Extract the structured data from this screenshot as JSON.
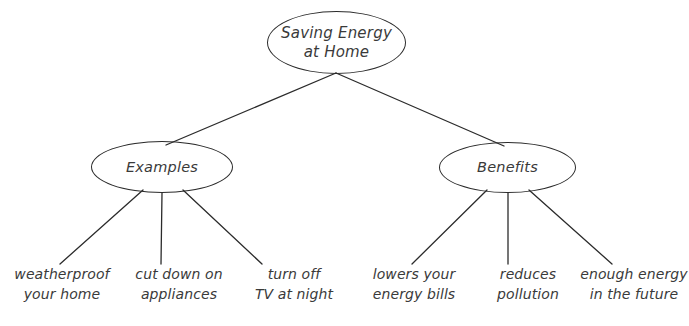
{
  "diagram": {
    "type": "concept-map",
    "stroke_color": "#2b2b2b",
    "text_color": "#3a3a3a",
    "background_color": "#ffffff",
    "root": {
      "label": "Saving Energy\nat Home"
    },
    "branches": [
      {
        "label": "Examples",
        "leaves": [
          {
            "label": "weatherproof\nyour home"
          },
          {
            "label": "cut down on\nappliances"
          },
          {
            "label": "turn off\nTV at night"
          }
        ]
      },
      {
        "label": "Benefits",
        "leaves": [
          {
            "label": "lowers your\nenergy bills"
          },
          {
            "label": "reduces\npollution"
          },
          {
            "label": "enough energy\nin the future"
          }
        ]
      }
    ]
  }
}
